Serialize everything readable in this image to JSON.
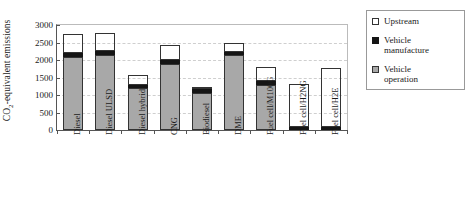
{
  "chart_data": {
    "type": "bar",
    "stacked": true,
    "title": "",
    "subtitle": "",
    "xlabel": "",
    "ylabel": "CO2-equivalent emissions",
    "ylabel_html": "CO<sub>2</sub>-equivalent emissions",
    "ylim": [
      0,
      3000
    ],
    "yticks": [
      0,
      500,
      1000,
      1500,
      2000,
      2500,
      3000
    ],
    "ytick_labels": [
      "0",
      "500",
      "1000",
      "1500",
      "2000",
      "2500",
      "3000"
    ],
    "grid": true,
    "grid_axis": "y",
    "legend_position": "right",
    "categories": [
      "Diesel",
      "Diesel ULSD",
      "Diesel hybrid",
      "CNG",
      "Biodiesel",
      "DME",
      "Fuel cell/M100G",
      "Fuel cell/H2NG",
      "Fuel cell/H2E"
    ],
    "series": [
      {
        "name": "Vehicle operation",
        "color": "#a8a8a8",
        "values": [
          2100,
          2150,
          1200,
          1900,
          1060,
          2140,
          1300,
          0,
          0
        ]
      },
      {
        "name": "Vehicle manufacture",
        "color": "#151515",
        "values": [
          100,
          100,
          100,
          100,
          100,
          90,
          110,
          90,
          90
        ]
      },
      {
        "name": "Upstream",
        "color": "#ffffff",
        "values": [
          550,
          530,
          260,
          420,
          20,
          250,
          400,
          1230,
          1670
        ]
      }
    ],
    "totals": [
      2750,
      2780,
      1560,
      2420,
      1180,
      2480,
      1810,
      1320,
      1760
    ]
  },
  "legend": {
    "items": [
      {
        "label_line1": "Upstream",
        "label_line2": "",
        "swatch": "upstream"
      },
      {
        "label_line1": "Vehicle",
        "label_line2": "manufacture",
        "swatch": "manufacture"
      },
      {
        "label_line1": "Vehicle",
        "label_line2": "operation",
        "swatch": "operation"
      }
    ]
  }
}
